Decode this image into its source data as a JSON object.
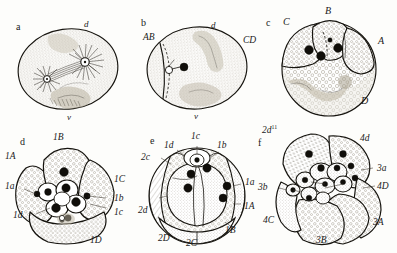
{
  "figure": {
    "background_color": "#fdfdfb",
    "ink_color": "#16140f",
    "panel_count": 6
  },
  "panels": [
    {
      "letter": "a",
      "caption": "fertilized egg with mitotic spindle and asters",
      "axis_labels": [
        {
          "text": "d",
          "role": "dorsal-pole"
        },
        {
          "text": "v",
          "role": "ventral-pole"
        }
      ],
      "labels": []
    },
    {
      "letter": "b",
      "caption": "two-cell stage",
      "axis_labels": [
        {
          "text": "d",
          "role": "dorsal-pole"
        },
        {
          "text": "v",
          "role": "ventral-pole"
        }
      ],
      "labels": [
        {
          "text": "AB",
          "role": "blastomere-ab"
        },
        {
          "text": "CD",
          "role": "blastomere-cd"
        }
      ]
    },
    {
      "letter": "c",
      "caption": "four-cell stage",
      "axis_labels": [],
      "labels": [
        {
          "text": "C",
          "role": "blastomere-c"
        },
        {
          "text": "B",
          "role": "blastomere-b"
        },
        {
          "text": "A",
          "role": "blastomere-a"
        },
        {
          "text": "D",
          "role": "blastomere-d"
        }
      ]
    },
    {
      "letter": "d",
      "caption": "eight-cell stage, first quartet of micromeres",
      "axis_labels": [],
      "labels": [
        {
          "text": "1B",
          "role": "macromere-1b"
        },
        {
          "text": "1A",
          "role": "macromere-1a"
        },
        {
          "text": "1a",
          "role": "micromere-1a"
        },
        {
          "text": "1d",
          "role": "micromere-1d"
        },
        {
          "text": "1C",
          "role": "macromere-1c"
        },
        {
          "text": "1b",
          "role": "micromere-1b"
        },
        {
          "text": "1c",
          "role": "micromere-1c"
        },
        {
          "text": "1D",
          "role": "macromere-1d"
        }
      ]
    },
    {
      "letter": "e",
      "caption": "sixteen-cell stage, second quartet of micromeres",
      "axis_labels": [],
      "labels": [
        {
          "text": "1c",
          "role": "micromere-1c"
        },
        {
          "text": "1d",
          "role": "micromere-1d"
        },
        {
          "text": "1b",
          "role": "micromere-1b"
        },
        {
          "text": "2c",
          "role": "micromere-2c"
        },
        {
          "text": "2d",
          "role": "micromere-2d"
        },
        {
          "text": "2D",
          "role": "macromere-2d"
        },
        {
          "text": "2C",
          "role": "macromere-2c"
        },
        {
          "text": "1B",
          "role": "macromere-1b"
        },
        {
          "text": "1A",
          "role": "macromere-1a"
        },
        {
          "text": "1a",
          "role": "micromere-1a"
        }
      ]
    },
    {
      "letter": "f",
      "caption": "later cleavage, third and fourth quartets",
      "axis_labels": [],
      "labels": [
        {
          "text": "2d",
          "sup": "11",
          "role": "micromere-2d11"
        },
        {
          "text": "4d",
          "role": "mesentoblast-4d"
        },
        {
          "text": "3a",
          "role": "micromere-3a"
        },
        {
          "text": "4D",
          "role": "macromere-4d"
        },
        {
          "text": "3A",
          "role": "macromere-3a"
        },
        {
          "text": "3B",
          "role": "macromere-3b"
        },
        {
          "text": "4C",
          "role": "macromere-4c"
        },
        {
          "text": "3b",
          "role": "micromere-3b"
        }
      ]
    }
  ]
}
